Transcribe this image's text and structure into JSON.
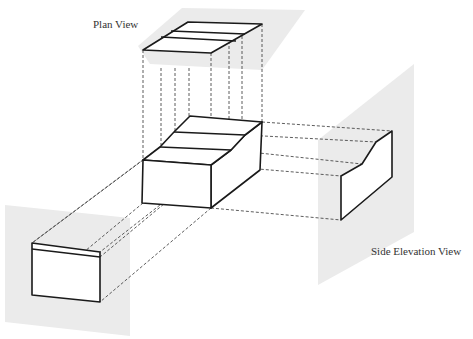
{
  "diagram": {
    "type": "orthographic-projection",
    "labels": {
      "plan_view": "Plan View",
      "side_elevation_view": "Side Elevation View"
    },
    "views": [
      {
        "name": "Plan View",
        "position": "top"
      },
      {
        "name": "Front View",
        "position": "left",
        "labeled": false
      },
      {
        "name": "Side Elevation View",
        "position": "right"
      }
    ],
    "colors": {
      "projection_plane": "#ebebeb",
      "outline": "#1a1a1a",
      "projection_line": "#333333",
      "background": "#ffffff"
    }
  }
}
